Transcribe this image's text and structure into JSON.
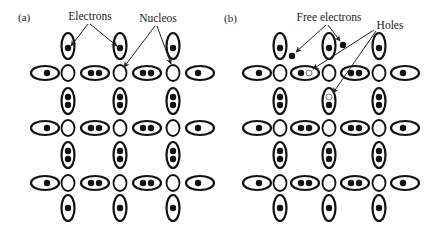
{
  "figure": {
    "panels": [
      {
        "id": "a",
        "label": "(a)",
        "annotations": [
          {
            "text": "Electrons",
            "role": "electrons-label"
          },
          {
            "text": "Nucleos",
            "role": "nucleos-label"
          }
        ],
        "description": "Intrinsic semiconductor lattice: nuclei with shared electron pairs (covalent bonds), no free carriers"
      },
      {
        "id": "b",
        "label": "(b)",
        "annotations": [
          {
            "text": "Free electrons",
            "role": "free-electrons-label"
          },
          {
            "text": "Holes",
            "role": "holes-label"
          }
        ],
        "description": "Lattice with broken bonds: two free electrons and two holes"
      }
    ],
    "lattice": {
      "nuclei_per_row": 3,
      "nucleus_rows": 3,
      "bond_electrons_horizontal": 2,
      "bond_electrons_vertical": 2,
      "edge_bond_electrons": 1
    },
    "panel_b_defects": {
      "free_electrons": 2,
      "holes": 2
    },
    "colors": {
      "ink": "#111111",
      "background": "#ffffff"
    }
  }
}
